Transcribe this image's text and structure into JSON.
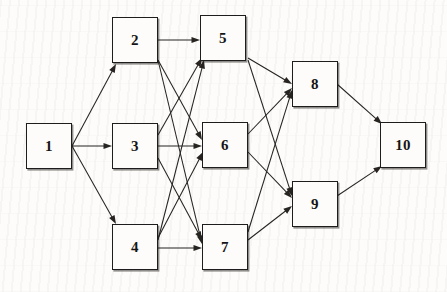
{
  "diagram": {
    "type": "directed-graph",
    "canvas": {
      "width": 447,
      "height": 292
    },
    "node_size": {
      "width": 46,
      "height": 46
    },
    "nodes": [
      {
        "id": "1",
        "label": "1",
        "x": 26,
        "y": 123,
        "layer": 0
      },
      {
        "id": "2",
        "label": "2",
        "x": 112,
        "y": 17,
        "layer": 1
      },
      {
        "id": "3",
        "label": "3",
        "x": 112,
        "y": 123,
        "layer": 1
      },
      {
        "id": "4",
        "label": "4",
        "x": 112,
        "y": 224,
        "layer": 1
      },
      {
        "id": "5",
        "label": "5",
        "x": 200,
        "y": 15,
        "layer": 2
      },
      {
        "id": "6",
        "label": "6",
        "x": 202,
        "y": 122,
        "layer": 2
      },
      {
        "id": "7",
        "label": "7",
        "x": 202,
        "y": 224,
        "layer": 2
      },
      {
        "id": "8",
        "label": "8",
        "x": 292,
        "y": 61,
        "layer": 3
      },
      {
        "id": "9",
        "label": "9",
        "x": 292,
        "y": 181,
        "layer": 3
      },
      {
        "id": "10",
        "label": "10",
        "x": 380,
        "y": 122,
        "layer": 4
      }
    ],
    "edges": [
      {
        "from": "1",
        "to": "2",
        "x1": 72,
        "y1": 146,
        "x2": 116,
        "y2": 64
      },
      {
        "from": "1",
        "to": "3",
        "x1": 72,
        "y1": 146,
        "x2": 112,
        "y2": 146
      },
      {
        "from": "1",
        "to": "4",
        "x1": 72,
        "y1": 146,
        "x2": 116,
        "y2": 224
      },
      {
        "from": "2",
        "to": "5",
        "x1": 158,
        "y1": 40,
        "x2": 200,
        "y2": 40
      },
      {
        "from": "2",
        "to": "6",
        "x1": 158,
        "y1": 60,
        "x2": 202,
        "y2": 140
      },
      {
        "from": "2",
        "to": "7",
        "x1": 158,
        "y1": 60,
        "x2": 202,
        "y2": 244
      },
      {
        "from": "3",
        "to": "5",
        "x1": 158,
        "y1": 135,
        "x2": 202,
        "y2": 58
      },
      {
        "from": "3",
        "to": "6",
        "x1": 158,
        "y1": 146,
        "x2": 202,
        "y2": 146
      },
      {
        "from": "3",
        "to": "7",
        "x1": 158,
        "y1": 158,
        "x2": 202,
        "y2": 240
      },
      {
        "from": "4",
        "to": "5",
        "x1": 158,
        "y1": 240,
        "x2": 204,
        "y2": 60
      },
      {
        "from": "4",
        "to": "6",
        "x1": 158,
        "y1": 238,
        "x2": 203,
        "y2": 152
      },
      {
        "from": "4",
        "to": "7",
        "x1": 158,
        "y1": 248,
        "x2": 202,
        "y2": 248
      },
      {
        "from": "5",
        "to": "8",
        "x1": 248,
        "y1": 58,
        "x2": 292,
        "y2": 84
      },
      {
        "from": "5",
        "to": "9",
        "x1": 248,
        "y1": 60,
        "x2": 292,
        "y2": 196
      },
      {
        "from": "6",
        "to": "8",
        "x1": 248,
        "y1": 134,
        "x2": 292,
        "y2": 88
      },
      {
        "from": "6",
        "to": "9",
        "x1": 248,
        "y1": 152,
        "x2": 292,
        "y2": 198
      },
      {
        "from": "7",
        "to": "8",
        "x1": 248,
        "y1": 232,
        "x2": 292,
        "y2": 90
      },
      {
        "from": "7",
        "to": "9",
        "x1": 248,
        "y1": 240,
        "x2": 292,
        "y2": 206
      },
      {
        "from": "8",
        "to": "10",
        "x1": 337,
        "y1": 84,
        "x2": 382,
        "y2": 124
      },
      {
        "from": "9",
        "to": "10",
        "x1": 337,
        "y1": 196,
        "x2": 382,
        "y2": 166
      }
    ]
  }
}
